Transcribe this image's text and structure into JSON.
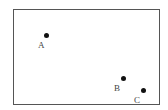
{
  "diagram": {
    "frame": {
      "left": 13,
      "top": 9,
      "width": 147,
      "height": 96,
      "border_color": "#555555"
    },
    "points": [
      {
        "label": "A",
        "dot": {
          "x": 46,
          "y": 35
        },
        "label_pos": {
          "x": 38,
          "y": 41
        }
      },
      {
        "label": "B",
        "dot": {
          "x": 123,
          "y": 78
        },
        "label_pos": {
          "x": 114,
          "y": 84
        }
      },
      {
        "label": "C",
        "dot": {
          "x": 143,
          "y": 90
        },
        "label_pos": {
          "x": 134,
          "y": 96
        }
      }
    ]
  }
}
